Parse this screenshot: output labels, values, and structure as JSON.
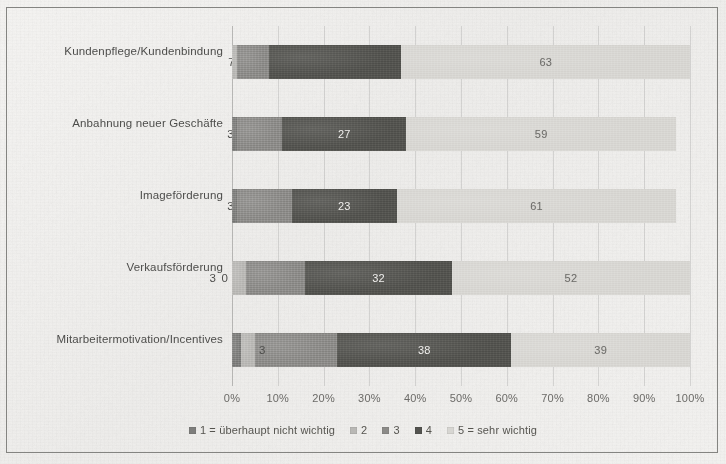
{
  "chart_data": {
    "type": "bar",
    "subtype": "horizontal-stacked-100-percent",
    "title": "",
    "xlabel": "",
    "ylabel": "",
    "xlim": [
      0,
      100
    ],
    "xtick_labels": [
      "0%",
      "10%",
      "20%",
      "30%",
      "40%",
      "50%",
      "60%",
      "70%",
      "80%",
      "90%",
      "100%"
    ],
    "xtick_values": [
      0,
      10,
      20,
      30,
      40,
      50,
      60,
      70,
      80,
      90,
      100
    ],
    "grid": true,
    "legend_position": "bottom",
    "categories": [
      "Kundenpflege/Kundenbindung",
      "Anbahnung neuer Geschäfte",
      "Imageförderung",
      "Verkaufsförderung",
      "Mitarbeitermotivation/Incentives"
    ],
    "series": [
      {
        "name": "1 = überhaupt nicht wichtig",
        "color": "#7e7e7c",
        "values": [
          0,
          1,
          1,
          0,
          2
        ]
      },
      {
        "name": "2",
        "color": "#b9b8b5",
        "values": [
          1,
          0,
          0,
          3,
          3
        ]
      },
      {
        "name": "3",
        "color": "#8c8b88",
        "values": [
          7,
          10,
          12,
          13,
          18
        ]
      },
      {
        "name": "4",
        "color": "#53534f",
        "values": [
          29,
          27,
          23,
          32,
          38
        ]
      },
      {
        "name": "5 = sehr wichtig",
        "color": "#d7d6d2",
        "values": [
          63,
          59,
          61,
          52,
          39
        ]
      }
    ],
    "rows": [
      {
        "category": "Kundenpflege/Kundenbindung",
        "segments": [
          {
            "series": "1",
            "value": 0,
            "label": "",
            "label_visible": false,
            "class": "s1"
          },
          {
            "series": "2",
            "value": 1,
            "label": "",
            "label_visible": false,
            "class": "s2"
          },
          {
            "series": "3",
            "value": 7,
            "label": "7",
            "label_visible": true,
            "label_outside": true,
            "class": "s3"
          },
          {
            "series": "4",
            "value": 29,
            "label": "29",
            "label_visible": false,
            "class": "s4"
          },
          {
            "series": "5",
            "value": 63,
            "label": "63",
            "label_visible": true,
            "class": "s5"
          }
        ]
      },
      {
        "category": "Anbahnung neuer Geschäfte",
        "segments": [
          {
            "series": "1",
            "value": 1,
            "label": "",
            "label_visible": false,
            "class": "s1"
          },
          {
            "series": "2",
            "value": 0,
            "label": "3",
            "label_visible": true,
            "label_outside": true,
            "class": "s2"
          },
          {
            "series": "3",
            "value": 10,
            "label": "10",
            "label_visible": false,
            "class": "s3"
          },
          {
            "series": "4",
            "value": 27,
            "label": "27",
            "label_visible": true,
            "class": "s4"
          },
          {
            "series": "5",
            "value": 59,
            "label": "59",
            "label_visible": true,
            "class": "s5"
          }
        ]
      },
      {
        "category": "Imageförderung",
        "segments": [
          {
            "series": "1",
            "value": 1,
            "label": "",
            "label_visible": false,
            "class": "s1"
          },
          {
            "series": "2",
            "value": 0,
            "label": "3",
            "label_visible": true,
            "label_outside": true,
            "class": "s2"
          },
          {
            "series": "3",
            "value": 12,
            "label": "12",
            "label_visible": false,
            "class": "s3"
          },
          {
            "series": "4",
            "value": 23,
            "label": "23",
            "label_visible": true,
            "class": "s4"
          },
          {
            "series": "5",
            "value": 61,
            "label": "61",
            "label_visible": true,
            "class": "s5"
          }
        ]
      },
      {
        "category": "Verkaufsförderung",
        "segments": [
          {
            "series": "1",
            "value": 0,
            "label": "0",
            "label_visible": true,
            "label_outside": true,
            "class": "s1"
          },
          {
            "series": "2",
            "value": 3,
            "label": "3",
            "label_visible": true,
            "label_outside": true,
            "class": "s2"
          },
          {
            "series": "3",
            "value": 13,
            "label": "13",
            "label_visible": false,
            "class": "s3"
          },
          {
            "series": "4",
            "value": 32,
            "label": "32",
            "label_visible": true,
            "class": "s4"
          },
          {
            "series": "5",
            "value": 52,
            "label": "52",
            "label_visible": true,
            "class": "s5"
          }
        ]
      },
      {
        "category": "Mitarbeitermotivation/Incentives",
        "segments": [
          {
            "series": "1",
            "value": 2,
            "label": "",
            "label_visible": false,
            "class": "s1"
          },
          {
            "series": "2",
            "value": 3,
            "label": "3",
            "label_visible": true,
            "label_inline": true,
            "class": "s2"
          },
          {
            "series": "3",
            "value": 18,
            "label": "18",
            "label_visible": false,
            "class": "s3"
          },
          {
            "series": "4",
            "value": 38,
            "label": "38",
            "label_visible": true,
            "class": "s4"
          },
          {
            "series": "5",
            "value": 39,
            "label": "39",
            "label_visible": true,
            "class": "s5"
          }
        ]
      }
    ],
    "legend": [
      {
        "label": "1 = überhaupt nicht wichtig",
        "color": "#7e7e7c"
      },
      {
        "label": "2",
        "color": "#b9b8b5"
      },
      {
        "label": "3",
        "color": "#8c8b88"
      },
      {
        "label": "4",
        "color": "#53534f"
      },
      {
        "label": "5 = sehr wichtig",
        "color": "#d7d6d2"
      }
    ]
  }
}
